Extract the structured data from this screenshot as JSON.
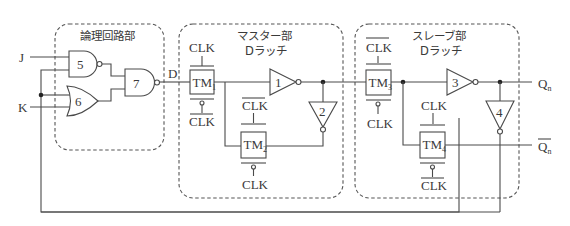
{
  "diagram": {
    "type": "JK flip-flop built from master-slave D latches with transmission gates",
    "blocks": {
      "logic": {
        "title": "論理回路部"
      },
      "master": {
        "title_line1": "マスター部",
        "title_line2": "Dラッチ"
      },
      "slave": {
        "title_line1": "スレーブ部",
        "title_line2": "Dラッチ"
      }
    },
    "inputs": {
      "j": "J",
      "k": "K"
    },
    "signals": {
      "d": "D",
      "q": "Q",
      "q_sub": "n",
      "qbar": "Q",
      "qbar_sub": "n"
    },
    "gates": {
      "g5": "5",
      "g6": "6",
      "g7": "7",
      "inv1": "1",
      "inv2": "2",
      "inv3": "3",
      "inv4": "4"
    },
    "transmission_gates": {
      "tm1": {
        "label": "TM",
        "sub": "1",
        "top": "CLK",
        "top_bar": false,
        "bottom": "CLK",
        "bottom_bar": true
      },
      "tm2": {
        "label": "TM",
        "sub": "2",
        "top": "CLK",
        "top_bar": true,
        "bottom": "CLK",
        "bottom_bar": false
      },
      "tm3": {
        "label": "TM",
        "sub": "3",
        "top": "CLK",
        "top_bar": true,
        "bottom": "CLK",
        "bottom_bar": false
      },
      "tm4": {
        "label": "TM",
        "sub": "4",
        "top": "CLK",
        "top_bar": false,
        "bottom": "CLK",
        "bottom_bar": true
      }
    },
    "colors": {
      "line": "#4a4a4a",
      "text": "#3a3a3a",
      "background": "#ffffff"
    }
  }
}
